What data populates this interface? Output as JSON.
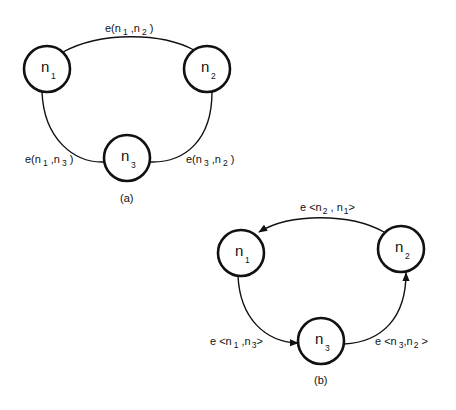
{
  "diagrams": [
    {
      "caption": "(a)",
      "directed": false,
      "nodes": [
        {
          "id": "n1",
          "base": "n",
          "sub": "1"
        },
        {
          "id": "n2",
          "base": "n",
          "sub": "2"
        },
        {
          "id": "n3",
          "base": "n",
          "sub": "3"
        }
      ],
      "edges": [
        {
          "from": "n1",
          "to": "n2",
          "label": {
            "prefix": "e(",
            "a": "n",
            "a_sub": "1",
            "sep": " ,",
            "b": "n",
            "b_sub": "2",
            "suffix": " )"
          }
        },
        {
          "from": "n1",
          "to": "n3",
          "label": {
            "prefix": "e(",
            "a": "n",
            "a_sub": "1",
            "sep": " ,",
            "b": "n",
            "b_sub": "3",
            "suffix": " )"
          }
        },
        {
          "from": "n3",
          "to": "n2",
          "label": {
            "prefix": "e(",
            "a": "n",
            "a_sub": "3",
            "sep": " ,",
            "b": "n",
            "b_sub": "2",
            "suffix": " )"
          }
        }
      ]
    },
    {
      "caption": "(b)",
      "directed": true,
      "nodes": [
        {
          "id": "n1",
          "base": "n",
          "sub": "1"
        },
        {
          "id": "n2",
          "base": "n",
          "sub": "2"
        },
        {
          "id": "n3",
          "base": "n",
          "sub": "3"
        }
      ],
      "edges": [
        {
          "from": "n2",
          "to": "n1",
          "label": {
            "prefix": "e <",
            "a": "n",
            "a_sub": "2",
            "sep": " , ",
            "b": "n",
            "b_sub": "1",
            "suffix": ">"
          }
        },
        {
          "from": "n1",
          "to": "n3",
          "label": {
            "prefix": "e <",
            "a": "n",
            "a_sub": "1",
            "sep": " ,",
            "b": "n",
            "b_sub": "3",
            "suffix": ">"
          }
        },
        {
          "from": "n3",
          "to": "n2",
          "label": {
            "prefix": "e <",
            "a": "n",
            "a_sub": "3",
            "sep": ",",
            "b": "n",
            "b_sub": "2",
            "suffix": " >"
          }
        }
      ]
    }
  ]
}
